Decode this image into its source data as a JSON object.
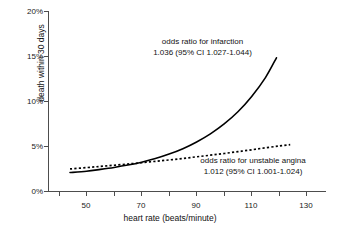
{
  "chart_data": {
    "type": "line",
    "title": "",
    "xlabel": "heart rate (beats/minute)",
    "ylabel": "death within 30 days",
    "xlim": [
      36,
      137
    ],
    "ylim": [
      0,
      20
    ],
    "grid": false,
    "legend_position": "inline-annotations",
    "x_ticks": [
      50,
      70,
      90,
      110,
      130
    ],
    "x_tick_labels": [
      "50",
      "70",
      "90",
      "110",
      "130"
    ],
    "x_minor_ticks": [
      40,
      60,
      80,
      100,
      120
    ],
    "y_ticks": [
      0,
      5,
      10,
      15,
      20
    ],
    "y_tick_labels": [
      "0%",
      "5%",
      "10%",
      "15%",
      "20%"
    ],
    "series": [
      {
        "name": "odds ratio for infarction",
        "style": "solid",
        "color": "#000000",
        "x": [
          44,
          50,
          55,
          60,
          65,
          70,
          75,
          80,
          85,
          90,
          95,
          100,
          105,
          110,
          115,
          119
        ],
        "values": [
          2.05,
          2.2,
          2.4,
          2.62,
          2.88,
          3.2,
          3.6,
          4.1,
          4.7,
          5.45,
          6.35,
          7.45,
          8.8,
          10.5,
          12.6,
          14.8
        ]
      },
      {
        "name": "odds ratio for unstable angina",
        "style": "dotted",
        "color": "#000000",
        "x": [
          44,
          50,
          55,
          60,
          65,
          70,
          75,
          80,
          85,
          90,
          95,
          100,
          105,
          110,
          115,
          120,
          124
        ],
        "values": [
          2.45,
          2.6,
          2.73,
          2.86,
          3.0,
          3.14,
          3.3,
          3.45,
          3.62,
          3.8,
          3.98,
          4.17,
          4.37,
          4.58,
          4.8,
          5.0,
          5.15
        ]
      }
    ],
    "annotations": [
      {
        "id": "infarction",
        "line1": "odds ratio for infarction",
        "line2": "1.036 (95% CI 1.027-1.044)"
      },
      {
        "id": "angina",
        "line1": "odds ratio for unstable angina",
        "line2": "1.012 (95% CI 1.001-1.024)"
      }
    ]
  }
}
